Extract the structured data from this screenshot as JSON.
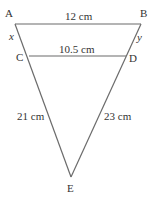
{
  "diagram": {
    "vertices": {
      "A": {
        "label": "A"
      },
      "B": {
        "label": "B"
      },
      "C": {
        "label": "C"
      },
      "D": {
        "label": "D"
      },
      "E": {
        "label": "E"
      }
    },
    "segments": {
      "AB": "12 cm",
      "CD": "10.5 cm",
      "AC": "x",
      "BD": "y",
      "CE": "21 cm",
      "DE": "23 cm"
    },
    "line_color": "#666666",
    "text_color": "#333333"
  }
}
